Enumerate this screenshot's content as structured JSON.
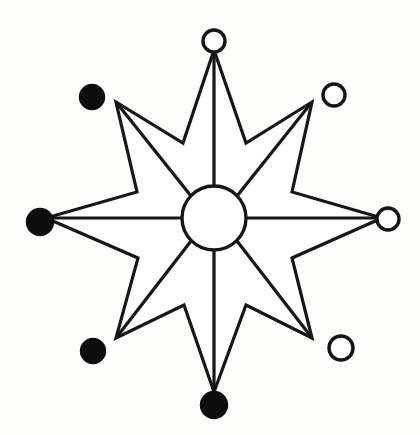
{
  "figure": {
    "type": "diagram",
    "background_color": "#fdfdfc",
    "stroke_color": "#161616",
    "fill_color": "#ffffff",
    "node_filled_color": "#0d0d0d",
    "node_hollow_fill": "#ffffff",
    "canvas": {
      "width": 420,
      "height": 435
    }
  },
  "hub": {
    "label": "central-hub",
    "center_x": 214,
    "center_y": 218,
    "radius": 32,
    "fill": "#ffffff",
    "stroke": "#161616"
  },
  "star": {
    "points": 8,
    "outer_radius": 168,
    "inner_radius": 48,
    "center_x": 214,
    "center_y": 218,
    "outline_path": "M 214 50 L 246 143 L 312 102 L 292 192 L 382 218 L 292 258 L 312 338 L 246 305 L 214 392 L 184 305 L 116 338 L 138 258 L 46 218 L 137 192 L 116 102 L 183 143 Z"
  },
  "nodes": [
    {
      "id": "node-n",
      "label": "north",
      "direction": "top",
      "style": "hollow",
      "cx": 214,
      "cy": 41,
      "r": 11,
      "angle_deg": 90,
      "tip_x": 214,
      "tip_y": 50
    },
    {
      "id": "node-ne",
      "label": "north-east",
      "direction": "top-right",
      "style": "hollow",
      "cx": 334,
      "cy": 95,
      "r": 11,
      "angle_deg": 45,
      "tip_x": 312,
      "tip_y": 102
    },
    {
      "id": "node-e",
      "label": "east",
      "direction": "right",
      "style": "hollow",
      "cx": 388,
      "cy": 219,
      "r": 11,
      "angle_deg": 0,
      "tip_x": 382,
      "tip_y": 218
    },
    {
      "id": "node-se",
      "label": "south-east",
      "direction": "bottom-right",
      "style": "hollow",
      "cx": 341,
      "cy": 348,
      "r": 12,
      "angle_deg": 315,
      "tip_x": 312,
      "tip_y": 338
    },
    {
      "id": "node-s",
      "label": "south",
      "direction": "bottom",
      "style": "filled",
      "cx": 214,
      "cy": 405,
      "r": 13,
      "angle_deg": 270,
      "tip_x": 214,
      "tip_y": 392
    },
    {
      "id": "node-sw",
      "label": "south-west",
      "direction": "bottom-left",
      "style": "filled",
      "cx": 93,
      "cy": 351,
      "r": 12,
      "angle_deg": 225,
      "tip_x": 116,
      "tip_y": 338
    },
    {
      "id": "node-w",
      "label": "west",
      "direction": "left",
      "style": "filled",
      "cx": 40,
      "cy": 222,
      "r": 13,
      "angle_deg": 180,
      "tip_x": 46,
      "tip_y": 218
    },
    {
      "id": "node-nw",
      "label": "north-west",
      "direction": "top-left",
      "style": "filled",
      "cx": 92,
      "cy": 97,
      "r": 12,
      "angle_deg": 135,
      "tip_x": 116,
      "tip_y": 102
    }
  ],
  "spokes": [
    {
      "id": "spoke-n",
      "label": "hub-to-north",
      "x1": 214,
      "y1": 186,
      "x2": 214,
      "y2": 50
    },
    {
      "id": "spoke-ne",
      "label": "hub-to-north-east",
      "x1": 237,
      "y1": 196,
      "x2": 312,
      "y2": 102
    },
    {
      "id": "spoke-e",
      "label": "hub-to-east",
      "x1": 246,
      "y1": 218,
      "x2": 382,
      "y2": 218
    },
    {
      "id": "spoke-se",
      "label": "hub-to-south-east",
      "x1": 237,
      "y1": 241,
      "x2": 312,
      "y2": 338
    },
    {
      "id": "spoke-s",
      "label": "hub-to-south",
      "x1": 214,
      "y1": 250,
      "x2": 214,
      "y2": 392
    },
    {
      "id": "spoke-sw",
      "label": "hub-to-south-west",
      "x1": 191,
      "y1": 241,
      "x2": 116,
      "y2": 338
    },
    {
      "id": "spoke-w",
      "label": "hub-to-west",
      "x1": 182,
      "y1": 218,
      "x2": 46,
      "y2": 218
    },
    {
      "id": "spoke-nw",
      "label": "hub-to-north-west",
      "x1": 191,
      "y1": 196,
      "x2": 116,
      "y2": 102
    }
  ],
  "legend": {
    "filled_meaning": "filled-node",
    "hollow_meaning": "hollow-node",
    "filled_count": 4,
    "hollow_count": 4
  }
}
